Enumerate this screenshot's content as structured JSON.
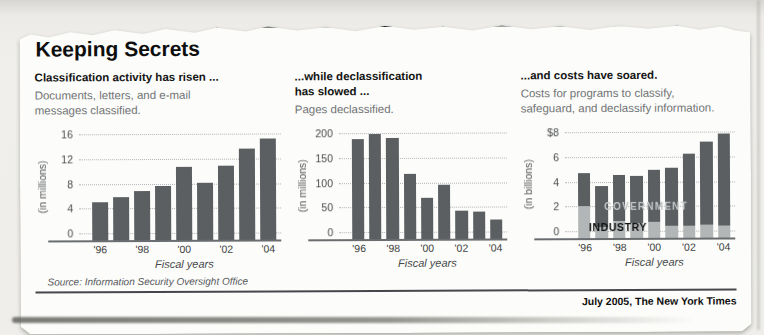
{
  "title": "Keeping Secrets",
  "source": "Source: Information Security Oversight Office",
  "credit": "July 2005, The New York Times",
  "colors": {
    "paper": "#fcfcfa",
    "bar_dark": "#5b5f62",
    "bar_light_industry": "#b3b6b7",
    "government_label": "#c4c7c8",
    "industry_label": "#0f0f0f",
    "rule_black": "#141414",
    "subtitle_gray": "#717476",
    "gridline_gray": "#b2b5b6"
  },
  "chart_data": [
    {
      "type": "bar",
      "heading": "Classification activity has risen ...",
      "subtitle": "Documents, letters, and e-mail\nmessages classified.",
      "unit_label": "(in millions)",
      "categories": [
        "1996",
        "1997",
        "1998",
        "1999",
        "2000",
        "2001",
        "2002",
        "2003",
        "2004"
      ],
      "x_tick_labels": [
        "'96",
        "",
        "'98",
        "",
        "'00",
        "",
        "'02",
        "",
        "'04"
      ],
      "xlabel": "Fiscal years",
      "ylim": [
        0,
        16
      ],
      "yticks": [
        0,
        4,
        8,
        12,
        16
      ],
      "ytick_labels": [
        "0",
        "4",
        "8",
        "12",
        "16"
      ],
      "values": [
        5.2,
        6.0,
        6.9,
        7.8,
        10.8,
        8.3,
        11.0,
        13.8,
        15.3
      ],
      "grid": "horizontal dotted",
      "legend": "none"
    },
    {
      "type": "bar",
      "heading": "...while declassification\nhas slowed ...",
      "subtitle": "Pages declassified.",
      "unit_label": "(in millions)",
      "categories": [
        "1996",
        "1997",
        "1998",
        "1999",
        "2000",
        "2001",
        "2002",
        "2003",
        "2004"
      ],
      "x_tick_labels": [
        "'96",
        "",
        "'98",
        "",
        "'00",
        "",
        "'02",
        "",
        "'04"
      ],
      "xlabel": "Fiscal years",
      "ylim": [
        0,
        200
      ],
      "yticks": [
        0,
        50,
        100,
        150,
        200
      ],
      "ytick_labels": [
        "0",
        "50",
        "100",
        "150",
        "200"
      ],
      "values": [
        190,
        200,
        191,
        120,
        70,
        96,
        45,
        43,
        26
      ],
      "grid": "horizontal dotted",
      "legend": "none"
    },
    {
      "type": "stacked-bar",
      "heading": "...and costs have soared.",
      "subtitle": "Costs for programs to classify,\nsafeguard, and declassify information.",
      "unit_label": "(in billions)",
      "categories": [
        "1996",
        "1997",
        "1998",
        "1999",
        "2000",
        "2001",
        "2002",
        "2003",
        "2004"
      ],
      "x_tick_labels": [
        "'96",
        "",
        "'98",
        "",
        "'00",
        "",
        "'02",
        "",
        "'04"
      ],
      "xlabel": "Fiscal years",
      "ylim": [
        0,
        8
      ],
      "yticks": [
        0,
        2,
        4,
        6,
        8
      ],
      "ytick_labels": [
        "0",
        "2",
        "4",
        "6",
        "$8"
      ],
      "series": [
        {
          "name": "INDUSTRY",
          "color": "#b3b6b7",
          "values": [
            2.1,
            0.4,
            0.9,
            0.7,
            0.8,
            0.5,
            0.5,
            0.6,
            0.5
          ]
        },
        {
          "name": "GOVERNMENT",
          "color": "#5b5f62",
          "values": [
            2.7,
            3.3,
            3.7,
            3.8,
            4.2,
            4.7,
            5.8,
            6.7,
            7.4
          ]
        }
      ],
      "overlay_labels": [
        {
          "key": "government",
          "text": "GOVERNMENT"
        },
        {
          "key": "industry",
          "text": "INDUSTRY"
        }
      ],
      "grid": "horizontal dotted",
      "legend": "inline overlay labels"
    }
  ]
}
